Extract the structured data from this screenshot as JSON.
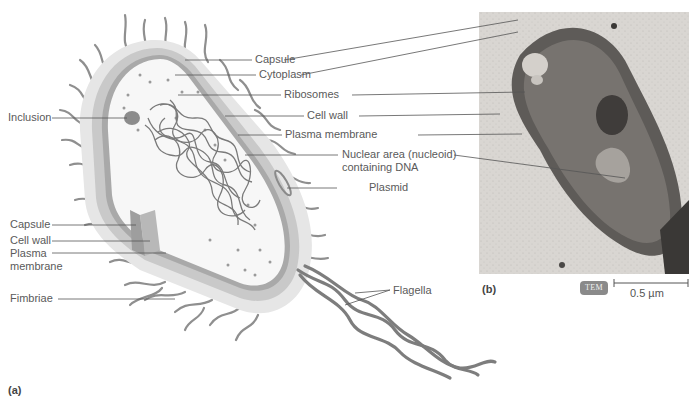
{
  "figure": {
    "panel_a": "(a)",
    "panel_b": "(b)"
  },
  "labels_right": [
    {
      "text": "Capsule"
    },
    {
      "text": "Cytoplasm"
    },
    {
      "text": "Ribosomes"
    },
    {
      "text": "Cell wall"
    },
    {
      "text": "Plasma membrane"
    },
    {
      "text": "Nuclear area (nucleoid)"
    },
    {
      "text": "containing DNA"
    },
    {
      "text": "Plasmid"
    },
    {
      "text": "Flagella"
    }
  ],
  "labels_left": [
    {
      "text": "Inclusion"
    },
    {
      "text": "Capsule"
    },
    {
      "text": "Cell wall"
    },
    {
      "text": "Plasma"
    },
    {
      "text": "membrane"
    },
    {
      "text": "Fimbriae"
    }
  ],
  "micrograph": {
    "badge": "TEM",
    "scale": "0.5 µm"
  },
  "colors": {
    "capsule": "#e6e6e6",
    "cell_wall": "#c9c9c9",
    "membrane": "#a9a9a9",
    "cytoplasm": "#f7f7f7",
    "dna": "#7a7a7a",
    "inclusion": "#8c8c8c",
    "fimbriae": "#8f8f8f",
    "flagella": "#7d7d7d",
    "leader_line": "#555555",
    "tem_bg": "#d9d6d2",
    "tem_cell": "#5e5b58"
  }
}
